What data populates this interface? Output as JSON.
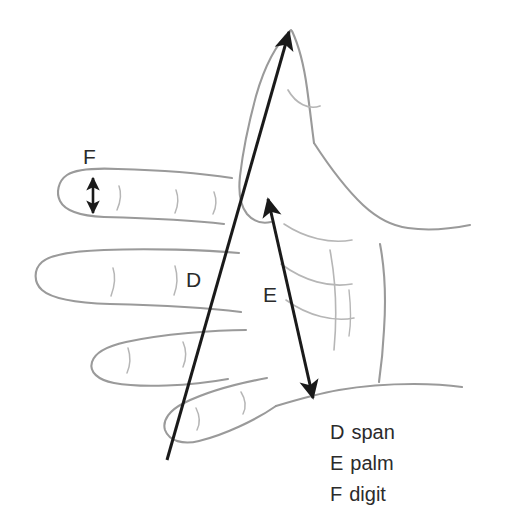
{
  "figure": {
    "colors": {
      "background": "#ffffff",
      "sketch_line": "#9a9a9a",
      "sketch_line_faint": "#b6b6b6",
      "arrow": "#1a1a1a",
      "text": "#2b2b2b"
    }
  },
  "diagram_labels": [
    {
      "key": "D",
      "name": "label-D",
      "measure": "span"
    },
    {
      "key": "E",
      "name": "label-E",
      "measure": "palm"
    },
    {
      "key": "F",
      "name": "label-F",
      "measure": "digit"
    }
  ],
  "arrows": [
    {
      "key": "D",
      "measure": "span",
      "style": "single-headed",
      "from": {
        "x": 167,
        "y": 460
      },
      "to": {
        "x": 289,
        "y": 32
      },
      "description": "thumb tip to little finger tip"
    },
    {
      "key": "E",
      "measure": "palm",
      "style": "double-headed",
      "from": {
        "x": 313,
        "y": 398
      },
      "to": {
        "x": 268,
        "y": 199
      },
      "description": "base of thumb web to wrist"
    },
    {
      "key": "F",
      "measure": "digit",
      "style": "double-headed",
      "from": {
        "x": 93,
        "y": 213
      },
      "to": {
        "x": 93,
        "y": 178
      },
      "description": "index finger width"
    }
  ],
  "legend": {
    "rows": [
      {
        "key": "D",
        "name": "span"
      },
      {
        "key": "E",
        "name": "palm"
      },
      {
        "key": "F",
        "name": "digit"
      }
    ]
  }
}
